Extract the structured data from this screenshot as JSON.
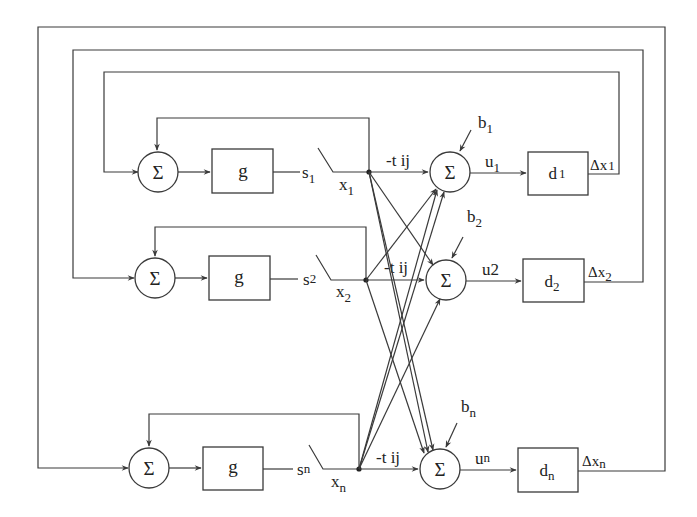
{
  "diagram": {
    "title": "",
    "type": "block-diagram",
    "rows": [
      {
        "id": "1",
        "input_sum_symbol": "Σ",
        "nonlinearity_label": "g",
        "switch_in": {
          "base": "s",
          "sub": "1"
        },
        "switch_out": {
          "base": "x",
          "sub": "1"
        },
        "weight_label": "-t ij",
        "bias": {
          "base": "b",
          "sub": "1"
        },
        "output_sum_symbol": "Σ",
        "u_label": {
          "base": "u",
          "sub": "1"
        },
        "delay": {
          "base": "d",
          "sub": "1"
        },
        "delta": {
          "base": "Δx",
          "sub": "1"
        }
      },
      {
        "id": "2",
        "input_sum_symbol": "Σ",
        "nonlinearity_label": "g",
        "switch_in": {
          "base": "s",
          "sub": "2"
        },
        "switch_out": {
          "base": "x",
          "sub": "2"
        },
        "weight_label": "-t ij",
        "bias": {
          "base": "b",
          "sub": "2"
        },
        "output_sum_symbol": "Σ",
        "u_label": {
          "base": "u2",
          "sub": ""
        },
        "delay": {
          "base": "d",
          "sub": "2"
        },
        "delta": {
          "base": "Δx",
          "sub": "2"
        }
      },
      {
        "id": "n",
        "input_sum_symbol": "Σ",
        "nonlinearity_label": "g",
        "switch_in": {
          "base": "s",
          "sub": "n"
        },
        "switch_out": {
          "base": "x",
          "sub": "n"
        },
        "weight_label": "-t ij",
        "bias": {
          "base": "b",
          "sub": "n"
        },
        "output_sum_symbol": "Σ",
        "u_label": {
          "base": "u",
          "sub": "n"
        },
        "delay": {
          "base": "d",
          "sub": "n"
        },
        "delta": {
          "base": "Δx",
          "sub": "n"
        }
      }
    ],
    "colors": {
      "line": "#3a3a3a",
      "text": "#222222",
      "background": "#ffffff"
    }
  }
}
